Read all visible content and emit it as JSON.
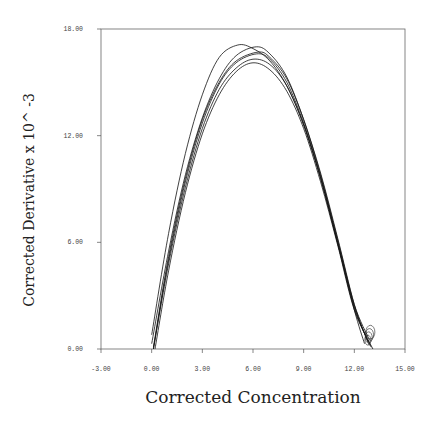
{
  "chart_data": {
    "type": "line",
    "title": "",
    "xlabel": "Corrected Concentration",
    "ylabel": "Corrected Derivative x 10^ -3",
    "xlim": [
      -3,
      15
    ],
    "ylim": [
      0,
      18
    ],
    "x_ticks": [
      "-3.00",
      "0.00",
      "3.00",
      "6.00",
      "9.00",
      "12.00",
      "15.00"
    ],
    "y_ticks": [
      "0.00",
      "6.00",
      "12.00",
      "18.00"
    ],
    "grid": false,
    "legend": null,
    "series": [
      {
        "name": "run-1",
        "x": [
          0.0,
          1.0,
          2.0,
          3.0,
          4.0,
          5.1,
          6.0,
          7.0,
          8.0,
          9.0,
          10.0,
          11.0,
          12.0,
          12.6
        ],
        "y": [
          0.8,
          6.5,
          11.0,
          14.3,
          16.4,
          17.1,
          16.9,
          16.2,
          14.8,
          12.6,
          9.6,
          6.0,
          2.2,
          0.3
        ]
      },
      {
        "name": "run-2",
        "x": [
          0.0,
          1.0,
          2.0,
          3.0,
          4.0,
          5.0,
          6.2,
          7.0,
          8.0,
          9.0,
          10.0,
          11.0,
          12.0,
          12.8
        ],
        "y": [
          0.3,
          5.5,
          9.8,
          13.0,
          15.2,
          16.5,
          17.0,
          16.6,
          15.3,
          12.9,
          9.9,
          6.3,
          2.5,
          0.4
        ]
      },
      {
        "name": "run-3",
        "x": [
          0.1,
          1.0,
          2.0,
          3.0,
          4.0,
          5.0,
          6.2,
          7.0,
          8.0,
          9.0,
          10.0,
          11.0,
          12.0,
          12.9
        ],
        "y": [
          0.0,
          5.0,
          9.4,
          12.7,
          14.9,
          16.1,
          16.6,
          16.3,
          15.0,
          12.7,
          9.7,
          6.1,
          2.4,
          0.2
        ]
      },
      {
        "name": "run-4",
        "x": [
          0.1,
          1.0,
          2.0,
          3.0,
          4.0,
          5.0,
          6.0,
          7.0,
          8.0,
          9.0,
          10.0,
          11.0,
          12.0,
          13.0
        ],
        "y": [
          0.0,
          4.8,
          9.1,
          12.4,
          14.6,
          15.8,
          16.3,
          16.0,
          14.8,
          12.6,
          9.6,
          6.0,
          2.3,
          0.1
        ]
      },
      {
        "name": "run-5",
        "x": [
          0.2,
          1.0,
          2.0,
          3.0,
          4.0,
          5.0,
          6.0,
          7.0,
          8.0,
          9.0,
          10.0,
          11.0,
          12.0,
          13.1
        ],
        "y": [
          0.0,
          4.4,
          8.8,
          12.1,
          14.3,
          15.6,
          16.1,
          15.7,
          14.5,
          12.4,
          9.4,
          5.9,
          2.2,
          0.0
        ]
      },
      {
        "name": "run-6",
        "x": [
          0.1,
          1.0,
          2.0,
          3.0,
          4.0,
          5.0,
          6.3,
          7.0,
          8.0,
          9.0,
          10.0,
          11.0,
          12.0,
          12.9
        ],
        "y": [
          0.1,
          5.2,
          9.6,
          12.9,
          15.0,
          16.2,
          16.7,
          16.4,
          15.2,
          12.9,
          9.8,
          6.2,
          2.5,
          0.5
        ]
      }
    ]
  }
}
